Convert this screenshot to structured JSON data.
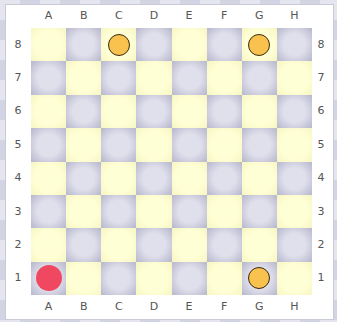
{
  "board": {
    "files": [
      "A",
      "B",
      "C",
      "D",
      "E",
      "F",
      "G",
      "H"
    ],
    "ranks": [
      "8",
      "7",
      "6",
      "5",
      "4",
      "3",
      "2",
      "1"
    ],
    "colors": {
      "light": "#ffffd6",
      "dark": "#d6d6e4"
    },
    "pieces": [
      {
        "square": "C8",
        "color": "#f9c14e",
        "border": "#3a2a10",
        "type": "orange-piece"
      },
      {
        "square": "G8",
        "color": "#f9c14e",
        "border": "#3a2a10",
        "type": "orange-piece"
      },
      {
        "square": "G1",
        "color": "#f9c14e",
        "border": "#3a2a10",
        "type": "orange-piece"
      },
      {
        "square": "A1",
        "color": "#f04860",
        "border": "none",
        "type": "red-piece"
      }
    ]
  }
}
